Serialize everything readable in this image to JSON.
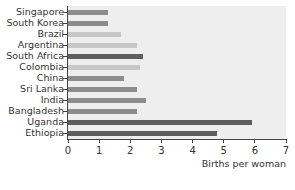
{
  "chart_data": {
    "type": "bar",
    "orientation": "horizontal",
    "title": "",
    "xlabel": "Births per woman",
    "ylabel": "",
    "xlim": [
      0,
      7
    ],
    "xticks": [
      "0",
      "1",
      "2",
      "3",
      "4",
      "5",
      "6",
      "7"
    ],
    "grid": false,
    "legend": null,
    "categories": [
      "Singapore",
      "South Korea",
      "Brazil",
      "Argentina",
      "South Africa",
      "Colombia",
      "China",
      "Sri Lanka",
      "India",
      "Bangladesh",
      "Uganda",
      "Ethiopia"
    ],
    "values": [
      1.3,
      1.3,
      1.7,
      2.2,
      2.4,
      2.3,
      1.8,
      2.2,
      2.5,
      2.2,
      5.9,
      4.8
    ],
    "bar_colors": [
      "#8c8c8c",
      "#8c8c8c",
      "#c8c8c8",
      "#c8c8c8",
      "#5e5e5e",
      "#c8c8c8",
      "#8c8c8c",
      "#8c8c8c",
      "#8c8c8c",
      "#8c8c8c",
      "#5e5e5e",
      "#5e5e5e"
    ]
  },
  "colors": {
    "plot_background": "#eeeeee",
    "axis": "#444444"
  }
}
